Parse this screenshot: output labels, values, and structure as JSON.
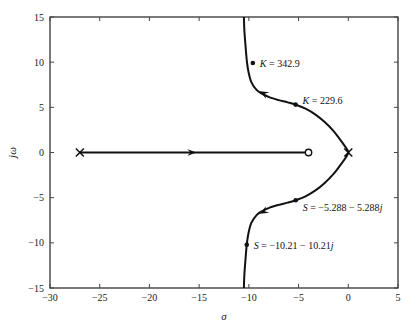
{
  "chart_data": {
    "type": "line",
    "title": "",
    "subtitle": "",
    "xlabel": "σ",
    "ylabel": "jω",
    "xlim": [
      -30,
      5
    ],
    "ylim": [
      -15,
      15
    ],
    "xticks": [
      -30,
      -25,
      -20,
      -15,
      -10,
      -5,
      0,
      5
    ],
    "xtick_labels": [
      "−30",
      "−25",
      "−20",
      "−15",
      "−10",
      "−5",
      "0",
      "5"
    ],
    "yticks": [
      -15,
      -10,
      -5,
      0,
      5,
      10,
      15
    ],
    "ytick_labels": [
      "−15",
      "−10",
      "−5",
      "0",
      "5",
      "10",
      "15"
    ],
    "grid": false,
    "legend": "none",
    "series": [
      {
        "name": "real-axis-locus",
        "comment": "branch along the real axis from the pole at -27 to the zero at -4",
        "points": [
          [
            -27,
            0
          ],
          [
            -4,
            0
          ]
        ]
      },
      {
        "name": "complex-locus",
        "comment": "branch departing the origin pole, bending left and going to vertical asymptote near sigma = -10.6",
        "points": [
          [
            -10.5,
            -15.0
          ],
          [
            -10.45,
            -13.5
          ],
          [
            -10.35,
            -12.0
          ],
          [
            -10.21,
            -10.21
          ],
          [
            -10.05,
            -9.0
          ],
          [
            -9.75,
            -7.8
          ],
          [
            -9.2,
            -6.9
          ],
          [
            -8.6,
            -6.45
          ],
          [
            -7.9,
            -6.1
          ],
          [
            -7.0,
            -5.8
          ],
          [
            -6.1,
            -5.55
          ],
          [
            -5.288,
            -5.288
          ],
          [
            -4.3,
            -4.85
          ],
          [
            -3.3,
            -4.2
          ],
          [
            -2.4,
            -3.4
          ],
          [
            -1.5,
            -2.4
          ],
          [
            -0.8,
            -1.4
          ],
          [
            -0.25,
            -0.55
          ],
          [
            0.0,
            0.0
          ],
          [
            -0.25,
            0.55
          ],
          [
            -0.8,
            1.4
          ],
          [
            -1.5,
            2.4
          ],
          [
            -2.4,
            3.4
          ],
          [
            -3.3,
            4.2
          ],
          [
            -4.3,
            4.85
          ],
          [
            -5.288,
            5.288
          ],
          [
            -6.1,
            5.55
          ],
          [
            -7.0,
            5.8
          ],
          [
            -7.9,
            6.1
          ],
          [
            -8.6,
            6.45
          ],
          [
            -9.2,
            6.9
          ],
          [
            -9.75,
            7.8
          ],
          [
            -10.05,
            9.0
          ],
          [
            -10.21,
            10.21
          ],
          [
            -10.35,
            12.0
          ],
          [
            -10.45,
            13.5
          ],
          [
            -10.5,
            15.0
          ]
        ]
      }
    ],
    "poles": [
      {
        "name": "pole-real-left",
        "x": -27,
        "y": 0,
        "symbol": "x"
      },
      {
        "name": "pole-origin",
        "x": 0,
        "y": 0,
        "symbol": "x"
      }
    ],
    "zeros": [
      {
        "name": "zero-real",
        "x": -4,
        "y": 0,
        "symbol": "o"
      }
    ],
    "markers": [
      {
        "name": "gain-marker-upper",
        "x": -9.6,
        "y": 9.9,
        "label": "K = 342.9",
        "label_italic_prefix": "K"
      },
      {
        "name": "gain-marker-mid-upper",
        "x": -5.3,
        "y": 5.3,
        "label": "K = 229.6",
        "label_italic_prefix": "K"
      },
      {
        "name": "root-marker-lower-inner",
        "x": -5.288,
        "y": -5.288,
        "label": "S = −5.288 − 5.288j",
        "label_italic_prefix": "S"
      },
      {
        "name": "root-marker-lower-outer",
        "x": -10.21,
        "y": -10.21,
        "label": "S = −10.21 − 10.21j",
        "label_italic_prefix": "S"
      }
    ],
    "direction_arrows": [
      {
        "name": "arrow-real-axis",
        "x": -15.3,
        "y": 0,
        "direction": "right"
      },
      {
        "name": "arrow-upper-branch",
        "x": -8.6,
        "y": 6.45,
        "direction": "up-left"
      },
      {
        "name": "arrow-lower-branch",
        "x": -8.6,
        "y": -6.45,
        "direction": "down-left"
      }
    ],
    "annotations": [
      "K = 342.9",
      "K = 229.6",
      "S = −5.288 − 5.288j",
      "S = −10.21 − 10.21j"
    ],
    "colors": {
      "locus": "#111111",
      "axis": "#222222",
      "text": "#1a1a1a",
      "background": "#ffffff"
    }
  }
}
